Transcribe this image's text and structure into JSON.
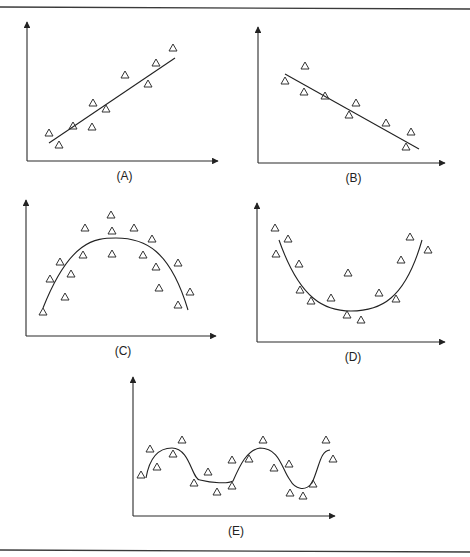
{
  "figure": {
    "panels": [
      {
        "id": "A",
        "label": "(A)",
        "pattern": "positive linear"
      },
      {
        "id": "B",
        "label": "(B)",
        "pattern": "negative linear"
      },
      {
        "id": "C",
        "label": "(C)",
        "pattern": "concave down (inverted U)"
      },
      {
        "id": "D",
        "label": "(D)",
        "pattern": "concave up (U-shaped)"
      },
      {
        "id": "E",
        "label": "(E)",
        "pattern": "periodic / sinusoidal"
      }
    ],
    "marker": "open triangle",
    "colors": {
      "ink": "#222222",
      "background": "#ffffff"
    }
  },
  "chart_data": [
    {
      "type": "scatter",
      "title": "(A)",
      "xlabel": "",
      "ylabel": "",
      "grid": false,
      "axes_px": {
        "origin": [
          27,
          161
        ],
        "x_end": 218,
        "y_end": 22
      },
      "points_px": [
        [
          49,
          133
        ],
        [
          59,
          145
        ],
        [
          73,
          126
        ],
        [
          93,
          103
        ],
        [
          92,
          127
        ],
        [
          106,
          109
        ],
        [
          125,
          75
        ],
        [
          148,
          84
        ],
        [
          156,
          63
        ],
        [
          173,
          48
        ]
      ],
      "fit": {
        "kind": "line",
        "path": "M49,143 L175,58"
      }
    },
    {
      "type": "scatter",
      "title": "(B)",
      "xlabel": "",
      "ylabel": "",
      "grid": false,
      "axes_px": {
        "origin": [
          258,
          163
        ],
        "x_end": 445,
        "y_end": 27
      },
      "points_px": [
        [
          285,
          81
        ],
        [
          305,
          66
        ],
        [
          304,
          92
        ],
        [
          325,
          96
        ],
        [
          349,
          115
        ],
        [
          356,
          103
        ],
        [
          386,
          123
        ],
        [
          411,
          132
        ],
        [
          406,
          147
        ]
      ],
      "fit": {
        "kind": "line",
        "path": "M285,74 L419,149"
      }
    },
    {
      "type": "scatter",
      "title": "(C)",
      "xlabel": "",
      "ylabel": "",
      "grid": false,
      "axes_px": {
        "origin": [
          26,
          336
        ],
        "x_end": 216,
        "y_end": 200
      },
      "points_px": [
        [
          43,
          312
        ],
        [
          50,
          279
        ],
        [
          60,
          262
        ],
        [
          65,
          297
        ],
        [
          71,
          274
        ],
        [
          85,
          228
        ],
        [
          83,
          255
        ],
        [
          111,
          215
        ],
        [
          112,
          231
        ],
        [
          112,
          254
        ],
        [
          134,
          228
        ],
        [
          152,
          239
        ],
        [
          143,
          255
        ],
        [
          156,
          267
        ],
        [
          159,
          288
        ],
        [
          178,
          263
        ],
        [
          178,
          305
        ],
        [
          190,
          292
        ]
      ],
      "fit": {
        "kind": "curve",
        "path": "M43,308 C70,240 95,238 116,238 C145,238 170,250 188,310"
      }
    },
    {
      "type": "scatter",
      "title": "(D)",
      "xlabel": "",
      "ylabel": "",
      "grid": false,
      "axes_px": {
        "origin": [
          257,
          342
        ],
        "x_end": 445,
        "y_end": 203
      },
      "points_px": [
        [
          275,
          228
        ],
        [
          288,
          239
        ],
        [
          276,
          254
        ],
        [
          299,
          264
        ],
        [
          300,
          290
        ],
        [
          311,
          301
        ],
        [
          331,
          298
        ],
        [
          348,
          273
        ],
        [
          347,
          315
        ],
        [
          361,
          320
        ],
        [
          379,
          293
        ],
        [
          396,
          299
        ],
        [
          410,
          237
        ],
        [
          401,
          260
        ],
        [
          428,
          250
        ]
      ],
      "fit": {
        "kind": "curve",
        "path": "M279,240 C300,300 325,311 351,311 C380,311 405,300 422,240"
      }
    },
    {
      "type": "scatter",
      "title": "(E)",
      "xlabel": "",
      "ylabel": "",
      "grid": false,
      "axes_px": {
        "origin": [
          133,
          516
        ],
        "x_end": 335,
        "y_end": 377
      },
      "points_px": [
        [
          141,
          475
        ],
        [
          150,
          449
        ],
        [
          157,
          467
        ],
        [
          173,
          454
        ],
        [
          182,
          440
        ],
        [
          194,
          483
        ],
        [
          208,
          472
        ],
        [
          217,
          492
        ],
        [
          232,
          486
        ],
        [
          232,
          460
        ],
        [
          249,
          459
        ],
        [
          263,
          440
        ],
        [
          274,
          468
        ],
        [
          289,
          464
        ],
        [
          290,
          493
        ],
        [
          303,
          496
        ],
        [
          313,
          484
        ],
        [
          326,
          440
        ],
        [
          333,
          459
        ]
      ],
      "fit": {
        "kind": "curve",
        "path": "M146,478 C150,455 160,448 172,448 C190,448 192,480 200,480 C212,483 228,484 233,481 C240,465 247,450 260,448 C280,448 282,470 290,480 C295,489 305,492 312,483 C320,465 320,451 330,450"
      }
    }
  ]
}
